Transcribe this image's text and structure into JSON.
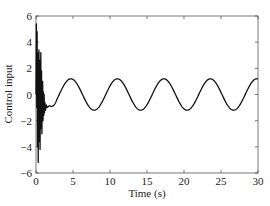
{
  "chart_data": {
    "type": "line",
    "title": "",
    "xlabel": "Time (s)",
    "ylabel": "Control input",
    "xlim": [
      0,
      30
    ],
    "ylim": [
      -6,
      6
    ],
    "xticks": [
      0,
      5,
      10,
      15,
      20,
      25,
      30
    ],
    "yticks": [
      -6,
      -4,
      -2,
      0,
      2,
      4,
      6
    ],
    "grid": false,
    "legend": null,
    "series": [
      {
        "name": "Control input",
        "color": "#111111",
        "description": "Large oscillatory transient for t < ~1.5 s (peaks ≈ +5.4, troughs ≈ -5.2), then settles into a sinusoid of amplitude ≈ 1.2 and period ≈ 6.28 s (≈ -1.2·sin(t))",
        "transient": [
          [
            0.0,
            0.0
          ],
          [
            0.05,
            5.4
          ],
          [
            0.1,
            -1.0
          ],
          [
            0.15,
            4.8
          ],
          [
            0.2,
            -4.0
          ],
          [
            0.25,
            3.2
          ],
          [
            0.3,
            -5.2
          ],
          [
            0.35,
            2.0
          ],
          [
            0.4,
            3.4
          ],
          [
            0.45,
            -3.6
          ],
          [
            0.5,
            2.6
          ],
          [
            0.55,
            -4.2
          ],
          [
            0.6,
            0.8
          ],
          [
            0.65,
            3.2
          ],
          [
            0.7,
            -2.6
          ],
          [
            0.75,
            1.8
          ],
          [
            0.8,
            -3.0
          ],
          [
            0.85,
            0.6
          ],
          [
            0.9,
            1.0
          ],
          [
            0.95,
            -2.0
          ],
          [
            1.0,
            0.2
          ],
          [
            1.05,
            -1.6
          ],
          [
            1.1,
            0.0
          ],
          [
            1.15,
            -1.4
          ],
          [
            1.2,
            -0.6
          ],
          [
            1.3,
            -1.2
          ],
          [
            1.4,
            -0.8
          ],
          [
            1.5,
            -1.0
          ],
          [
            1.6,
            -0.95
          ],
          [
            1.8,
            -0.85
          ]
        ],
        "steady_state": {
          "amplitude": 1.2,
          "angular_frequency": 1.0,
          "phase": 3.14159,
          "form": "A*sin(w*t + phase)",
          "t_start": 1.8,
          "t_end": 30
        }
      }
    ]
  },
  "axes": {
    "x_tick_labels": [
      "0",
      "5",
      "10",
      "15",
      "20",
      "25",
      "30"
    ],
    "y_tick_labels": [
      "−6",
      "−4",
      "−2",
      "0",
      "2",
      "4",
      "6"
    ]
  }
}
